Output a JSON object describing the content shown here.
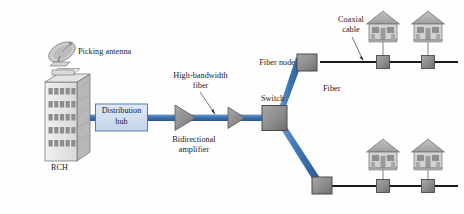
{
  "figure": {
    "type": "network-architecture-diagram",
    "background_color": "#fefefe"
  },
  "colors": {
    "fiber_blue": "#3f76b5",
    "fiber_blue_dark": "#2f5d94",
    "coax_black": "#1a1a1a",
    "node_gray": "#8c8c8c",
    "node_gray_dark": "#6e6e6e",
    "hub_fill": "#cfdcee",
    "hub_border": "#4a6fa5",
    "building_face": "#e8e8e8",
    "building_side": "#b8b8b8",
    "house_roof": "#b0b0b0",
    "house_body": "#d0d0d0",
    "text": "#1a1a1a"
  },
  "labels": {
    "picking_antenna": "Picking antenna",
    "rch": "RCH",
    "distribution_hub_line1": "Distribution",
    "distribution_hub_line2": "hub",
    "high_bandwidth_fiber_line1": "High-bandwidth",
    "high_bandwidth_fiber_line2": "fiber",
    "bidirectional_amplifier_line1": "Bidirectional",
    "bidirectional_amplifier_line2": "amplifier",
    "switch": "Switch",
    "fiber": "Fiber",
    "fiber_node": "Fiber node",
    "coaxial_cable_line1": "Coaxial",
    "coaxial_cable_line2": "cable"
  },
  "nodes": [
    {
      "id": "headend-building",
      "name": "RCH building",
      "label": "RCH"
    },
    {
      "id": "antenna",
      "name": "Picking antenna",
      "label": "Picking antenna"
    },
    {
      "id": "distribution-hub",
      "name": "Distribution hub",
      "label": "Distribution hub"
    },
    {
      "id": "amplifier-1",
      "name": "Bidirectional amplifier",
      "label": "Bidirectional amplifier"
    },
    {
      "id": "amplifier-2",
      "name": "Bidirectional amplifier",
      "label": "Bidirectional amplifier"
    },
    {
      "id": "switch",
      "name": "Switch",
      "label": "Switch"
    },
    {
      "id": "fiber-node-upper",
      "name": "Fiber node",
      "label": "Fiber node"
    },
    {
      "id": "fiber-node-lower",
      "name": "Fiber node",
      "label": "Fiber node"
    }
  ],
  "links": [
    {
      "id": "link-hub-to-building",
      "name": "High-bandwidth fiber",
      "medium": "fiber"
    },
    {
      "id": "link-hub-to-switch",
      "name": "High-bandwidth fiber",
      "medium": "fiber"
    },
    {
      "id": "link-switch-upper",
      "name": "Fiber",
      "medium": "fiber"
    },
    {
      "id": "link-switch-lower",
      "name": "Fiber",
      "medium": "fiber"
    },
    {
      "id": "link-coax-upper",
      "name": "Coaxial cable",
      "medium": "coax"
    },
    {
      "id": "link-coax-lower",
      "name": "Coaxial cable",
      "medium": "coax"
    }
  ],
  "subscribers": {
    "upper_branch_count": 2,
    "lower_branch_count": 2,
    "tap_count_per_branch": 2
  }
}
